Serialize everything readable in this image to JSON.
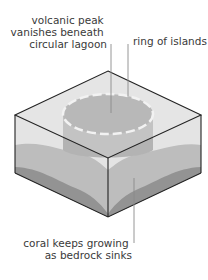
{
  "diagram": {
    "type": "atoll formation block diagram",
    "labels": {
      "volcanic_peak": [
        "volcanic peak",
        "vanishes beneath",
        "circular lagoon"
      ],
      "ring": "ring of islands",
      "coral": [
        "coral keeps growing",
        "as bedrock sinks"
      ]
    },
    "colors": {
      "outline": "#222222",
      "water": "#e4e4e4",
      "top_face": "#cfcfcf",
      "coral": "#bdbdbd",
      "bedrock": "#939393",
      "cylinder": "#b0b0b0",
      "ring_dash": "#f2f2f2",
      "leader": "#8a8a8a",
      "text": "#3a3a3a"
    }
  }
}
